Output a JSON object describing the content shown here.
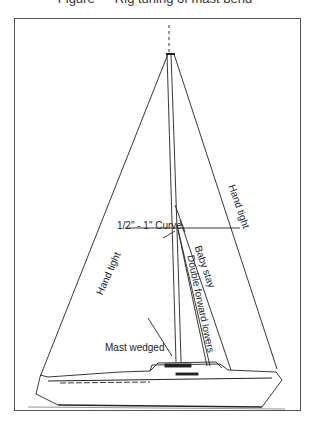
{
  "header": {
    "caption_cut": "Figure — Rig tuning of mast bend"
  },
  "diagram": {
    "labels": {
      "curve": "1/2\" - 1\" Curve",
      "hand_tight_left": "Hand tight",
      "hand_tight_right": "Hand tight",
      "baby_stay": "Baby stay",
      "double_forward_lowers": "Double forward lowers",
      "mast_wedged": "Mast wedged"
    },
    "colors": {
      "line": "#222222",
      "frame": "#555555",
      "background": "#ffffff"
    }
  }
}
